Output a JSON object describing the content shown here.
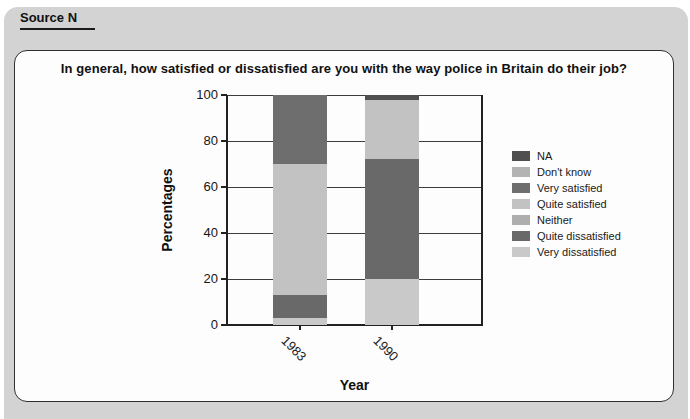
{
  "source_label": "Source N",
  "panel": {
    "title": "In general, how satisfied or dissatisfied are you with the way police in Britain do their job?"
  },
  "chart_data": {
    "type": "bar",
    "stacked": true,
    "title": "In general, how satisfied or dissatisfied are you with the way police in Britain do their job?",
    "xlabel": "Year",
    "ylabel": "Percentages",
    "ylim": [
      0,
      100
    ],
    "yticks": [
      0,
      20,
      40,
      60,
      80,
      100
    ],
    "grid": true,
    "legend_position": "right",
    "categories": [
      "1983",
      "1990"
    ],
    "stack_note": "segments stack bottom-to-top in reverse legend order",
    "series": [
      {
        "name": "NA",
        "color": "#4f4f4f",
        "values": [
          0,
          2
        ]
      },
      {
        "name": "Don't know",
        "color": "#b3b3b3",
        "values": [
          0,
          0
        ]
      },
      {
        "name": "Very satisfied",
        "color": "#6e6e6e",
        "values": [
          30,
          0
        ]
      },
      {
        "name": "Quite satisfied",
        "color": "#c2c2c2",
        "values": [
          57,
          26
        ]
      },
      {
        "name": "Neither",
        "color": "#aeaeae",
        "values": [
          0,
          0
        ]
      },
      {
        "name": "Quite dissatisfied",
        "color": "#696969",
        "values": [
          10,
          52
        ]
      },
      {
        "name": "Very dissatisfied",
        "color": "#c9c9c9",
        "values": [
          3,
          20
        ]
      }
    ]
  }
}
